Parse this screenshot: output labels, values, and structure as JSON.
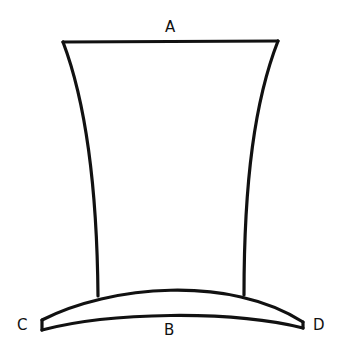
{
  "diagram": {
    "stroke_color": "#111111",
    "background": "#ffffff",
    "labels": {
      "a": "A",
      "b": "B",
      "c": "C",
      "d": "D"
    },
    "parts": [
      {
        "id": "crown",
        "description": "flared crown, top edge labeled A"
      },
      {
        "id": "brim",
        "description": "curved brim, bottom labeled B, left tip C, right tip D"
      }
    ]
  }
}
